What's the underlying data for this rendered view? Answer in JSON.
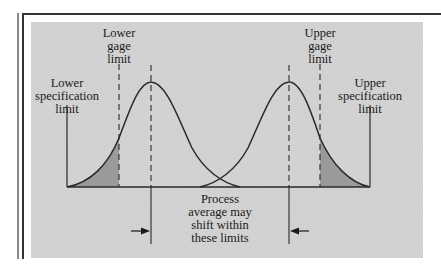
{
  "diagram": {
    "labels": {
      "lower_gage_limit": "Lower\ngage\nlimit",
      "upper_gage_limit": "Upper\ngage\nlimit",
      "lower_spec_limit": "Lower\nspecification\nlimit",
      "upper_spec_limit": "Upper\nspecification\nlimit",
      "process_note": "Process\naverage may\nshift within\nthese limits"
    },
    "elements": [
      {
        "id": "left-distribution",
        "type": "normal-curve",
        "mean_x": 151
      },
      {
        "id": "right-distribution",
        "type": "normal-curve",
        "mean_x": 289
      },
      {
        "id": "lower-spec-line",
        "type": "solid-vertical"
      },
      {
        "id": "upper-spec-line",
        "type": "solid-vertical"
      },
      {
        "id": "lower-gage-line",
        "type": "dashed-vertical"
      },
      {
        "id": "upper-gage-line",
        "type": "dashed-vertical"
      },
      {
        "id": "left-mean-line",
        "type": "dashed-vertical"
      },
      {
        "id": "right-mean-line",
        "type": "dashed-vertical"
      },
      {
        "id": "left-tail-shaded",
        "type": "shaded-area"
      },
      {
        "id": "right-tail-shaded",
        "type": "shaded-area"
      },
      {
        "id": "shift-arrow-right",
        "direction": "right"
      },
      {
        "id": "shift-arrow-left",
        "direction": "left"
      }
    ],
    "colors": {
      "background": "#d4d4d4",
      "shade": "#9a9a9a",
      "line": "#2a2a2a"
    }
  }
}
